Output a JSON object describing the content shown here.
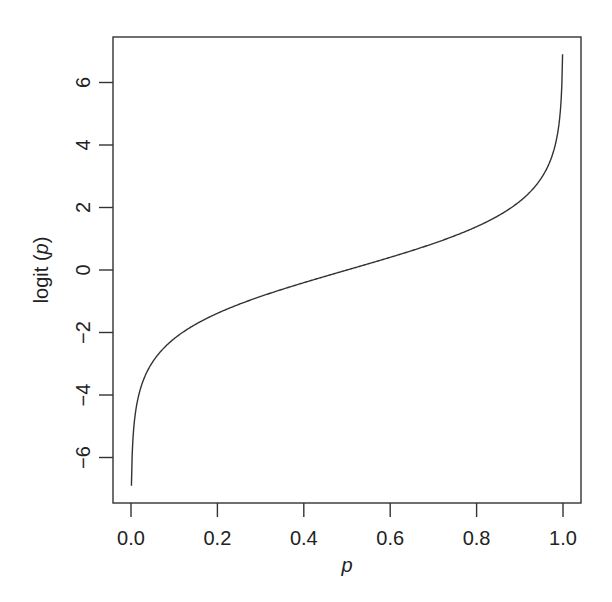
{
  "chart_data": {
    "type": "line",
    "title": "",
    "xlabel": "p",
    "ylabel_prefix": "logit",
    "ylabel_arg": "p",
    "xlim": [
      -0.04,
      1.04
    ],
    "ylim": [
      -7.5,
      7.3
    ],
    "grid": false,
    "legend": null,
    "x_ticks": [
      0.0,
      0.2,
      0.4,
      0.6,
      0.8,
      1.0
    ],
    "x_tick_labels": [
      "0.0",
      "0.2",
      "0.4",
      "0.6",
      "0.8",
      "1.0"
    ],
    "y_ticks": [
      -6,
      -4,
      -2,
      0,
      2,
      4,
      6
    ],
    "y_tick_labels": [
      "−6",
      "−4",
      "−2",
      "0",
      "2",
      "4",
      "6"
    ],
    "series": [
      {
        "name": "logit(p)",
        "function": "log(p/(1-p))",
        "p_range": [
          0.001,
          0.999
        ],
        "x": [
          0.001,
          0.01,
          0.05,
          0.1,
          0.2,
          0.3,
          0.4,
          0.5,
          0.6,
          0.7,
          0.8,
          0.9,
          0.95,
          0.99,
          0.999
        ],
        "values": [
          -6.91,
          -4.6,
          -2.94,
          -2.2,
          -1.39,
          -0.85,
          -0.41,
          0.0,
          0.41,
          0.85,
          1.39,
          2.2,
          2.94,
          4.6,
          6.91
        ]
      }
    ],
    "colors": {
      "line": "#333333",
      "axis": "#333333"
    }
  }
}
